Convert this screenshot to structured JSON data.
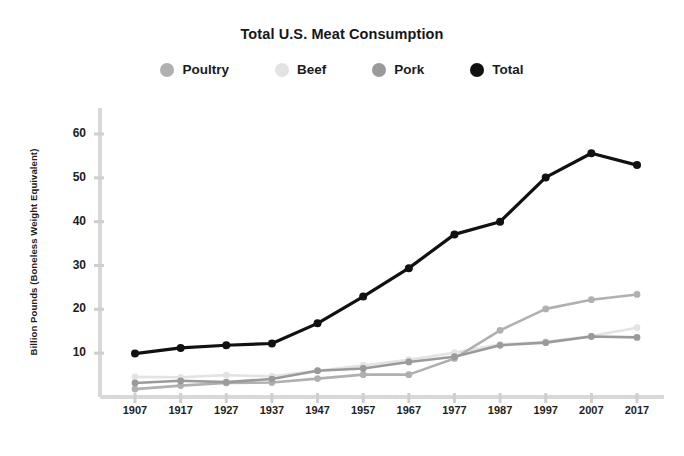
{
  "chart_data": {
    "type": "line",
    "title": "Total U.S. Meat Consumption",
    "xlabel": "",
    "ylabel": "Billion Pounds  (Boneless Weight Equivalent)",
    "categories": [
      "1907",
      "1917",
      "1927",
      "1937",
      "1947",
      "1957",
      "1967",
      "1977",
      "1987",
      "1997",
      "2007",
      "2017"
    ],
    "x": [
      1907,
      1917,
      1927,
      1937,
      1947,
      1957,
      1967,
      1977,
      1987,
      1997,
      2007,
      2017
    ],
    "ylim": [
      0,
      64
    ],
    "xlim": [
      1902,
      2022
    ],
    "yticks": [
      10,
      20,
      30,
      40,
      50,
      60
    ],
    "ytick_labels": [
      "10",
      "20",
      "30",
      "40",
      "50",
      "60"
    ],
    "grid": false,
    "legend_position": "top-center",
    "series": [
      {
        "name": "Poultry",
        "color": "#b0b0b0",
        "values": [
          1.8,
          2.6,
          3.2,
          3.3,
          4.2,
          5.1,
          5.1,
          8.8,
          15.2,
          20.1,
          22.2,
          23.4
        ]
      },
      {
        "name": "Beef",
        "color": "#e3e3e3",
        "values": [
          4.6,
          4.5,
          5.0,
          4.7,
          6.0,
          7.2,
          8.5,
          10.1,
          12.0,
          12.6,
          13.9,
          15.8
        ]
      },
      {
        "name": "Pork",
        "color": "#9a9a9a",
        "values": [
          3.2,
          3.7,
          3.4,
          4.1,
          6.0,
          6.5,
          8.0,
          9.2,
          11.8,
          12.4,
          13.8,
          13.6
        ]
      },
      {
        "name": "Total",
        "color": "#111111",
        "values": [
          9.9,
          11.2,
          11.8,
          12.2,
          16.8,
          22.9,
          29.4,
          37.1,
          40.0,
          50.1,
          55.6,
          52.9
        ]
      }
    ]
  },
  "legend": {
    "items": [
      {
        "label": "Poultry"
      },
      {
        "label": "Beef"
      },
      {
        "label": "Pork"
      },
      {
        "label": "Total"
      }
    ]
  },
  "style": {
    "axis_color": "#d8d8d8",
    "tick_color": "#cfcfcf",
    "background": "#ffffff",
    "text_color": "#1e1e1e"
  }
}
